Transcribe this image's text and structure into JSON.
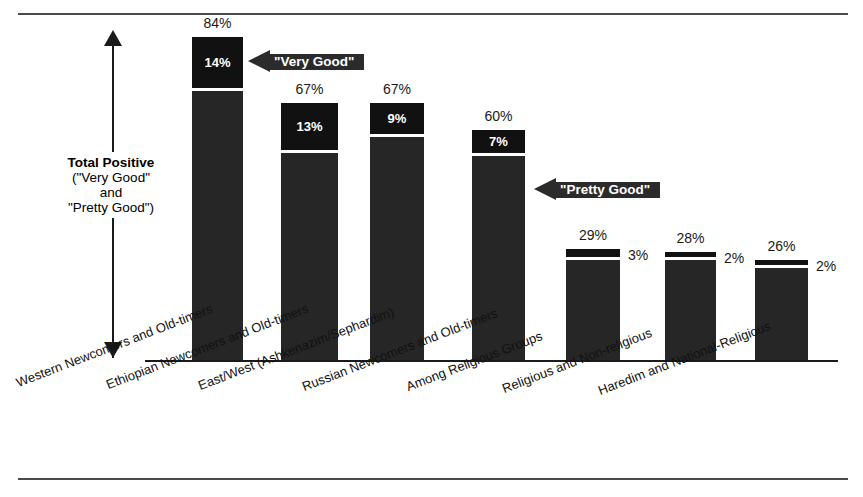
{
  "chart_data": {
    "type": "bar",
    "title": "",
    "subtitle": "",
    "xlabel": "",
    "ylabel": "Total Positive (\"Very Good\" and \"Pretty Good\")",
    "ylim": [
      0,
      100
    ],
    "grid": false,
    "legend_position": "none",
    "stacked": true,
    "categories": [
      "Western Newcomers and Old-timers",
      "Ethiopian Newcomers and Old-timers",
      "East/West (Ashkenazim/Sephardim)",
      "Russian Newcomers and Old-timers",
      "Among Religious Groups",
      "Religious and Non-religious",
      "Haredim and National-Religious"
    ],
    "series": [
      {
        "name": "\"Very Good\"",
        "values": [
          14,
          13,
          9,
          7,
          3,
          2,
          2
        ]
      },
      {
        "name": "\"Pretty Good\"",
        "values": [
          70,
          54,
          58,
          53,
          26,
          26,
          24
        ]
      }
    ],
    "totals": [
      84,
      67,
      67,
      60,
      29,
      28,
      26
    ],
    "total_labels": [
      "84%",
      "67%",
      "67%",
      "60%",
      "29%",
      "28%",
      "26%"
    ],
    "very_good_labels": [
      "14%",
      "13%",
      "9%",
      "7%",
      "3%",
      "2%",
      "2%"
    ],
    "very_good_label_placement": [
      "inside",
      "inside",
      "inside",
      "inside",
      "right",
      "right",
      "right"
    ],
    "annotations": [
      {
        "text": "\"Very Good\"",
        "target": "top-segment"
      },
      {
        "text": "\"Pretty Good\"",
        "target": "bottom-segment"
      }
    ],
    "axis_caption": {
      "line1": "Total Positive",
      "line2": "(\"Very Good\"",
      "line3": "and",
      "line4": "\"Pretty Good\")"
    },
    "colors": {
      "very_good": "#111111",
      "pretty_good": "#262626",
      "divider": "#ffffff",
      "callout": "#2b2b2b",
      "axis": "#1a1a1a",
      "rule": "#4a4a4a",
      "background": "#ffffff",
      "text": "#000000"
    }
  },
  "bars": [
    {
      "total_label": "84%",
      "top_label": "14%",
      "side_label": ""
    },
    {
      "total_label": "67%",
      "top_label": "13%",
      "side_label": ""
    },
    {
      "total_label": "67%",
      "top_label": "9%",
      "side_label": ""
    },
    {
      "total_label": "60%",
      "top_label": "7%",
      "side_label": ""
    },
    {
      "total_label": "29%",
      "top_label": "",
      "side_label": "3%"
    },
    {
      "total_label": "28%",
      "top_label": "",
      "side_label": "2%"
    },
    {
      "total_label": "26%",
      "top_label": "",
      "side_label": "2%"
    }
  ],
  "callouts": {
    "very_good": "\"Very Good\"",
    "pretty_good": "\"Pretty Good\""
  },
  "caption": {
    "line1": "Total Positive",
    "line2": "(\"Very Good\"",
    "line3": "and",
    "line4": "\"Pretty Good\")"
  },
  "categories": [
    "Western Newcomers and Old-timers",
    "Ethiopian Newcomers and Old-timers",
    "East/West (Ashkenazim/Sephardim)",
    "Russian Newcomers and Old-timers",
    "Among Religious Groups",
    "Religious and Non-religious",
    "Haredim and National-Religious"
  ]
}
